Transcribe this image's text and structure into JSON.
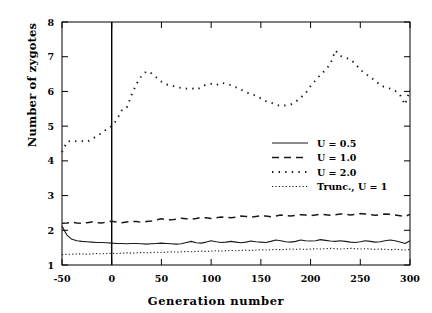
{
  "chart_data": {
    "type": "line",
    "title": "",
    "xlabel": "Generation number",
    "ylabel": "Number of zygotes",
    "xlim": [
      -50,
      300
    ],
    "ylim": [
      1,
      8
    ],
    "xticks": [
      -50,
      0,
      50,
      100,
      150,
      200,
      250,
      300
    ],
    "xtick_labels": [
      "-50",
      "0",
      "50",
      "100",
      "150",
      "200",
      "250",
      "300"
    ],
    "yticks": [
      1,
      2,
      3,
      4,
      5,
      6,
      7,
      8
    ],
    "ytick_labels": [
      "1",
      "2",
      "3",
      "4",
      "5",
      "6",
      "7",
      "8"
    ],
    "grid": false,
    "legend_position": "center-right",
    "annotations": [
      {
        "type": "vline",
        "x": 0,
        "label": "intervention at generation 0"
      }
    ],
    "series": [
      {
        "name": "U = 0.5",
        "style": "solid",
        "x": [
          -50,
          -45,
          -40,
          -35,
          -30,
          -25,
          -20,
          -15,
          -10,
          -5,
          0,
          5,
          10,
          15,
          20,
          25,
          30,
          35,
          40,
          45,
          50,
          55,
          60,
          65,
          70,
          75,
          80,
          85,
          90,
          95,
          100,
          105,
          110,
          115,
          120,
          125,
          130,
          135,
          140,
          145,
          150,
          155,
          160,
          165,
          170,
          175,
          180,
          185,
          190,
          195,
          200,
          205,
          210,
          215,
          220,
          225,
          230,
          235,
          240,
          245,
          250,
          255,
          260,
          265,
          270,
          275,
          280,
          285,
          290,
          295,
          300
        ],
        "values": [
          2.12,
          1.86,
          1.74,
          1.7,
          1.68,
          1.67,
          1.66,
          1.65,
          1.65,
          1.64,
          1.63,
          1.62,
          1.62,
          1.61,
          1.62,
          1.62,
          1.61,
          1.6,
          1.61,
          1.62,
          1.63,
          1.62,
          1.61,
          1.6,
          1.61,
          1.65,
          1.68,
          1.64,
          1.63,
          1.66,
          1.7,
          1.67,
          1.65,
          1.66,
          1.68,
          1.66,
          1.64,
          1.66,
          1.69,
          1.67,
          1.66,
          1.65,
          1.68,
          1.72,
          1.7,
          1.67,
          1.66,
          1.68,
          1.72,
          1.7,
          1.69,
          1.7,
          1.73,
          1.71,
          1.69,
          1.68,
          1.7,
          1.68,
          1.66,
          1.65,
          1.67,
          1.7,
          1.68,
          1.66,
          1.67,
          1.7,
          1.72,
          1.7,
          1.66,
          1.62,
          1.7
        ]
      },
      {
        "name": "U = 1.0",
        "style": "dashed",
        "x": [
          -50,
          -45,
          -40,
          -35,
          -30,
          -25,
          -20,
          -15,
          -10,
          -5,
          0,
          5,
          10,
          15,
          20,
          25,
          30,
          35,
          40,
          45,
          50,
          55,
          60,
          65,
          70,
          75,
          80,
          85,
          90,
          95,
          100,
          105,
          110,
          115,
          120,
          125,
          130,
          135,
          140,
          145,
          150,
          155,
          160,
          165,
          170,
          175,
          180,
          185,
          190,
          195,
          200,
          205,
          210,
          215,
          220,
          225,
          230,
          235,
          240,
          245,
          250,
          255,
          260,
          265,
          270,
          275,
          280,
          285,
          290,
          295,
          300
        ],
        "values": [
          2.2,
          2.21,
          2.23,
          2.21,
          2.2,
          2.22,
          2.24,
          2.22,
          2.21,
          2.24,
          2.26,
          2.24,
          2.22,
          2.24,
          2.26,
          2.25,
          2.23,
          2.25,
          2.27,
          2.3,
          2.33,
          2.31,
          2.3,
          2.32,
          2.35,
          2.33,
          2.32,
          2.34,
          2.37,
          2.36,
          2.34,
          2.36,
          2.38,
          2.37,
          2.36,
          2.38,
          2.41,
          2.4,
          2.38,
          2.4,
          2.42,
          2.41,
          2.39,
          2.41,
          2.44,
          2.43,
          2.41,
          2.43,
          2.45,
          2.44,
          2.42,
          2.44,
          2.46,
          2.45,
          2.43,
          2.45,
          2.47,
          2.46,
          2.44,
          2.46,
          2.48,
          2.47,
          2.45,
          2.43,
          2.45,
          2.47,
          2.46,
          2.44,
          2.42,
          2.4,
          2.46
        ]
      },
      {
        "name": "U = 2.0",
        "style": "dotted-sparse",
        "x": [
          -50,
          -45,
          -40,
          -35,
          -30,
          -25,
          -20,
          -15,
          -10,
          -5,
          0,
          5,
          10,
          15,
          20,
          25,
          30,
          35,
          40,
          45,
          50,
          55,
          60,
          65,
          70,
          75,
          80,
          85,
          90,
          95,
          100,
          105,
          110,
          115,
          120,
          125,
          130,
          135,
          140,
          145,
          150,
          155,
          160,
          165,
          170,
          175,
          180,
          185,
          190,
          195,
          200,
          205,
          210,
          215,
          220,
          225,
          230,
          235,
          240,
          245,
          250,
          255,
          260,
          265,
          270,
          275,
          280,
          285,
          290,
          295,
          300
        ],
        "values": [
          4.25,
          4.55,
          4.58,
          4.56,
          4.57,
          4.55,
          4.62,
          4.72,
          4.8,
          4.92,
          5.0,
          5.18,
          5.45,
          5.52,
          5.9,
          6.22,
          6.45,
          6.58,
          6.52,
          6.4,
          6.28,
          6.2,
          6.18,
          6.12,
          6.1,
          6.08,
          6.1,
          6.05,
          6.12,
          6.2,
          6.22,
          6.18,
          6.25,
          6.22,
          6.18,
          6.12,
          6.05,
          5.98,
          5.92,
          5.88,
          5.8,
          5.72,
          5.68,
          5.62,
          5.58,
          5.6,
          5.62,
          5.7,
          5.82,
          5.95,
          6.15,
          6.32,
          6.48,
          6.62,
          6.8,
          7.18,
          7.02,
          6.98,
          6.92,
          6.8,
          6.62,
          6.52,
          6.4,
          6.32,
          6.18,
          6.12,
          6.08,
          6.02,
          5.9,
          5.62,
          6.05
        ]
      },
      {
        "name": "Trunc., U = 1",
        "style": "dotted-fine",
        "x": [
          -50,
          -45,
          -40,
          -35,
          -30,
          -25,
          -20,
          -15,
          -10,
          -5,
          0,
          5,
          10,
          15,
          20,
          25,
          30,
          35,
          40,
          45,
          50,
          55,
          60,
          65,
          70,
          75,
          80,
          85,
          90,
          95,
          100,
          105,
          110,
          115,
          120,
          125,
          130,
          135,
          140,
          145,
          150,
          155,
          160,
          165,
          170,
          175,
          180,
          185,
          190,
          195,
          200,
          205,
          210,
          215,
          220,
          225,
          230,
          235,
          240,
          245,
          250,
          255,
          260,
          265,
          270,
          275,
          280,
          285,
          290,
          295,
          300
        ],
        "values": [
          1.3,
          1.31,
          1.31,
          1.32,
          1.32,
          1.31,
          1.32,
          1.33,
          1.32,
          1.33,
          1.34,
          1.33,
          1.34,
          1.35,
          1.34,
          1.35,
          1.36,
          1.35,
          1.36,
          1.37,
          1.36,
          1.37,
          1.38,
          1.37,
          1.38,
          1.39,
          1.38,
          1.39,
          1.4,
          1.39,
          1.4,
          1.41,
          1.4,
          1.41,
          1.42,
          1.41,
          1.42,
          1.43,
          1.42,
          1.43,
          1.44,
          1.43,
          1.44,
          1.45,
          1.44,
          1.45,
          1.46,
          1.45,
          1.46,
          1.45,
          1.46,
          1.47,
          1.46,
          1.47,
          1.48,
          1.47,
          1.46,
          1.47,
          1.48,
          1.47,
          1.46,
          1.47,
          1.46,
          1.45,
          1.46,
          1.45,
          1.44,
          1.45,
          1.44,
          1.43,
          1.45
        ]
      }
    ],
    "legend": [
      {
        "label": "U = 0.5",
        "style": "solid"
      },
      {
        "label": "U = 1.0",
        "style": "dashed"
      },
      {
        "label": "U = 2.0",
        "style": "dotted-sparse"
      },
      {
        "label": "Trunc., U = 1",
        "style": "dotted-fine"
      }
    ]
  }
}
